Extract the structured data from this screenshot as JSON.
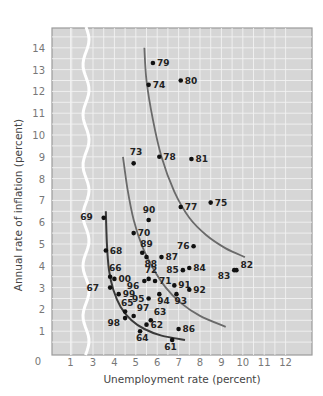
{
  "chart_data": {
    "type": "scatter",
    "title": "",
    "xlabel": "Unemployment rate (percent)",
    "ylabel": "Annual rate of inflation (percent)",
    "x_ticks": [
      "0",
      "1",
      "3",
      "4",
      "5",
      "6",
      "7",
      "8",
      "9",
      "10",
      "11",
      "12"
    ],
    "y_ticks": [
      "0",
      "1",
      "2",
      "3",
      "4",
      "5",
      "6",
      "7",
      "8",
      "9",
      "10",
      "11",
      "12",
      "13",
      "14"
    ],
    "xlim": [
      0,
      12.5
    ],
    "ylim": [
      0,
      14.5
    ],
    "axis_break": {
      "between": [
        1,
        3
      ],
      "style": "wavy"
    },
    "grid": true,
    "legend": null,
    "points": [
      {
        "label": "61",
        "x": 6.7,
        "y": 0.6
      },
      {
        "label": "62",
        "x": 5.5,
        "y": 1.3
      },
      {
        "label": "63",
        "x": 5.7,
        "y": 1.5
      },
      {
        "label": "64",
        "x": 5.2,
        "y": 1.0
      },
      {
        "label": "65",
        "x": 4.5,
        "y": 1.9
      },
      {
        "label": "66",
        "x": 3.8,
        "y": 3.5
      },
      {
        "label": "67",
        "x": 3.8,
        "y": 3.0
      },
      {
        "label": "68",
        "x": 3.6,
        "y": 4.7
      },
      {
        "label": "69",
        "x": 3.5,
        "y": 6.2
      },
      {
        "label": "70",
        "x": 4.9,
        "y": 5.5
      },
      {
        "label": "71",
        "x": 5.9,
        "y": 3.3
      },
      {
        "label": "72",
        "x": 5.6,
        "y": 3.4
      },
      {
        "label": "73",
        "x": 4.9,
        "y": 8.7
      },
      {
        "label": "74",
        "x": 5.6,
        "y": 12.3
      },
      {
        "label": "75",
        "x": 8.5,
        "y": 6.9
      },
      {
        "label": "76",
        "x": 7.7,
        "y": 4.9
      },
      {
        "label": "77",
        "x": 7.1,
        "y": 6.7
      },
      {
        "label": "78",
        "x": 6.1,
        "y": 9.0
      },
      {
        "label": "79",
        "x": 5.8,
        "y": 13.3
      },
      {
        "label": "80",
        "x": 7.1,
        "y": 12.5
      },
      {
        "label": "81",
        "x": 7.6,
        "y": 8.9
      },
      {
        "label": "82",
        "x": 9.7,
        "y": 3.8
      },
      {
        "label": "83",
        "x": 9.6,
        "y": 3.8
      },
      {
        "label": "84",
        "x": 7.5,
        "y": 3.9
      },
      {
        "label": "85",
        "x": 7.2,
        "y": 3.8
      },
      {
        "label": "86",
        "x": 7.0,
        "y": 1.1
      },
      {
        "label": "87",
        "x": 6.2,
        "y": 4.4
      },
      {
        "label": "88",
        "x": 5.5,
        "y": 4.4
      },
      {
        "label": "89",
        "x": 5.3,
        "y": 4.6
      },
      {
        "label": "90",
        "x": 5.6,
        "y": 6.1
      },
      {
        "label": "91",
        "x": 6.8,
        "y": 3.1
      },
      {
        "label": "92",
        "x": 7.5,
        "y": 2.9
      },
      {
        "label": "93",
        "x": 6.9,
        "y": 2.7
      },
      {
        "label": "94",
        "x": 6.1,
        "y": 2.7
      },
      {
        "label": "95",
        "x": 5.6,
        "y": 2.5
      },
      {
        "label": "96",
        "x": 5.4,
        "y": 3.3
      },
      {
        "label": "97",
        "x": 4.9,
        "y": 1.7
      },
      {
        "label": "98",
        "x": 4.5,
        "y": 1.6
      },
      {
        "label": "99",
        "x": 4.2,
        "y": 2.7
      },
      {
        "label": "00",
        "x": 4.0,
        "y": 3.4
      }
    ],
    "curves": [
      {
        "name": "phillips-curve-1960s",
        "points": [
          [
            3.6,
            6.5
          ],
          [
            3.65,
            5
          ],
          [
            3.75,
            3.8
          ],
          [
            3.95,
            2.9
          ],
          [
            4.3,
            2.1
          ],
          [
            4.8,
            1.5
          ],
          [
            5.4,
            1.1
          ],
          [
            6.2,
            0.8
          ],
          [
            7.3,
            0.6
          ]
        ]
      },
      {
        "name": "phillips-curve-1990s",
        "points": [
          [
            4.4,
            9.0
          ],
          [
            4.6,
            7.6
          ],
          [
            4.9,
            6.1
          ],
          [
            5.3,
            4.9
          ],
          [
            5.8,
            3.9
          ],
          [
            6.4,
            3.0
          ],
          [
            7.1,
            2.3
          ],
          [
            8.0,
            1.7
          ],
          [
            9.2,
            1.2
          ]
        ]
      },
      {
        "name": "phillips-curve-1970s-80s",
        "points": [
          [
            5.4,
            14.0
          ],
          [
            5.5,
            12.5
          ],
          [
            5.8,
            10.7
          ],
          [
            6.2,
            9.0
          ],
          [
            6.8,
            7.4
          ],
          [
            7.5,
            6.2
          ],
          [
            8.3,
            5.4
          ],
          [
            9.2,
            4.8
          ],
          [
            10.1,
            4.4
          ]
        ]
      }
    ]
  }
}
